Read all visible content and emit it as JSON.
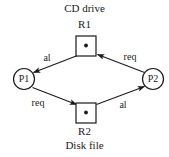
{
  "diagram": {
    "type": "resource-allocation-graph",
    "stroke_color": "#1a1a1a",
    "text_color": "#1a1a1a",
    "background_color": "#ffffff",
    "resources": [
      {
        "id": "R1",
        "id_label": "R1",
        "caption": "CD drive",
        "caption_position": "above",
        "shape": "square",
        "instances": 1,
        "x": 86,
        "y": 46,
        "size": 20
      },
      {
        "id": "R2",
        "id_label": "R2",
        "caption": "Disk file",
        "caption_position": "below",
        "shape": "square",
        "instances": 1,
        "x": 86,
        "y": 113,
        "size": 20
      }
    ],
    "processes": [
      {
        "id": "P1",
        "label": "P1",
        "shape": "circle",
        "x": 24,
        "y": 79,
        "radius": 11
      },
      {
        "id": "P2",
        "label": "P2",
        "shape": "circle",
        "x": 153,
        "y": 79,
        "radius": 11
      }
    ],
    "edges": [
      {
        "from": "R1",
        "to": "P1",
        "label": "al",
        "kind": "allocation",
        "label_x": 47,
        "label_y": 58
      },
      {
        "from": "P2",
        "to": "R1",
        "label": "req",
        "kind": "request",
        "label_x": 130,
        "label_y": 57
      },
      {
        "from": "P1",
        "to": "R2",
        "label": "req",
        "kind": "request",
        "label_x": 38,
        "label_y": 103
      },
      {
        "from": "R2",
        "to": "P2",
        "label": "al",
        "kind": "allocation",
        "label_x": 123,
        "label_y": 105
      }
    ]
  }
}
